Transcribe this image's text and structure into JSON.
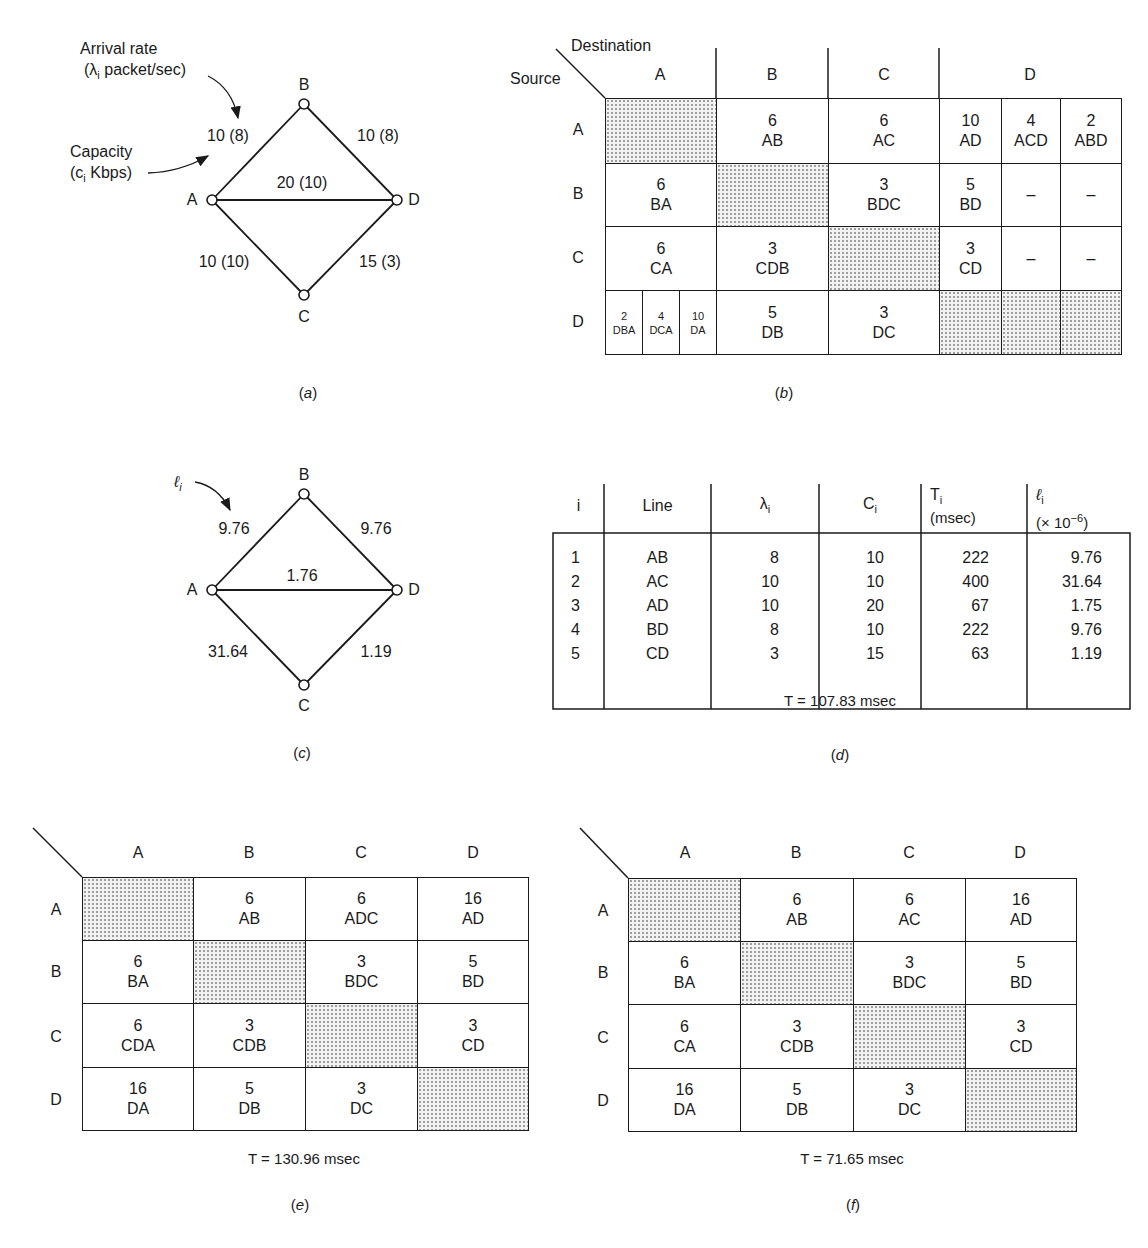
{
  "panel_a": {
    "caption": "a",
    "annotations": {
      "arrival_rate_title": "Arrival rate",
      "arrival_rate_unit": "(λ",
      "arrival_rate_sub": "i",
      "arrival_rate_unit_rest": " packet/sec)",
      "capacity_title": "Capacity",
      "capacity_unit": "(c",
      "capacity_sub": "i",
      "capacity_unit_rest": " Kbps)"
    },
    "nodes": [
      "A",
      "B",
      "C",
      "D"
    ],
    "edges": [
      {
        "line": "AB",
        "label": "10 (8)",
        "capacity": 10,
        "arrival_rate": 8
      },
      {
        "line": "BD",
        "label": "10 (8)",
        "capacity": 10,
        "arrival_rate": 8
      },
      {
        "line": "AD",
        "label": "20 (10)",
        "capacity": 20,
        "arrival_rate": 10
      },
      {
        "line": "AC",
        "label": "10 (10)",
        "capacity": 10,
        "arrival_rate": 10
      },
      {
        "line": "CD",
        "label": "15 (3)",
        "capacity": 15,
        "arrival_rate": 3
      }
    ]
  },
  "panel_b": {
    "caption": "b",
    "corner_destination": "Destination",
    "corner_source": "Source",
    "col_headers": [
      "A",
      "B",
      "C",
      "D"
    ],
    "row_headers": [
      "A",
      "B",
      "C",
      "D"
    ],
    "rows": {
      "A": {
        "A": null,
        "B": {
          "v": "6",
          "r": "AB"
        },
        "C": {
          "v": "6",
          "r": "AC"
        },
        "D": [
          {
            "v": "10",
            "r": "AD"
          },
          {
            "v": "4",
            "r": "ACD"
          },
          {
            "v": "2",
            "r": "ABD"
          }
        ]
      },
      "B": {
        "A": {
          "v": "6",
          "r": "BA"
        },
        "B": null,
        "C": {
          "v": "3",
          "r": "BDC"
        },
        "D": [
          {
            "v": "5",
            "r": "BD"
          },
          {
            "v": "–",
            "r": ""
          },
          {
            "v": "–",
            "r": ""
          }
        ]
      },
      "C": {
        "A": {
          "v": "6",
          "r": "CA"
        },
        "B": {
          "v": "3",
          "r": "CDB"
        },
        "C": null,
        "D": [
          {
            "v": "3",
            "r": "CD"
          },
          {
            "v": "–",
            "r": ""
          },
          {
            "v": "–",
            "r": ""
          }
        ]
      },
      "D": {
        "A": [
          {
            "v": "2",
            "r": "DBA"
          },
          {
            "v": "4",
            "r": "DCA"
          },
          {
            "v": "10",
            "r": "DA"
          }
        ],
        "B": {
          "v": "5",
          "r": "DB"
        },
        "C": {
          "v": "3",
          "r": "DC"
        },
        "D": null
      }
    }
  },
  "panel_c": {
    "caption": "c",
    "annotation": "ℓ",
    "annotation_sub": "i",
    "nodes": [
      "A",
      "B",
      "C",
      "D"
    ],
    "edges": [
      {
        "line": "AB",
        "label": "9.76"
      },
      {
        "line": "BD",
        "label": "9.76"
      },
      {
        "line": "AD",
        "label": "1.76"
      },
      {
        "line": "AC",
        "label": "31.64"
      },
      {
        "line": "CD",
        "label": "1.19"
      }
    ]
  },
  "panel_d": {
    "caption": "d",
    "headers": {
      "i": "i",
      "line": "Line",
      "lambda": "λ",
      "lambda_sub": "i",
      "c": "C",
      "c_sub": "i",
      "t": "T",
      "t_sub": "i",
      "t_unit": "(msec)",
      "l": "ℓ",
      "l_sub": "i",
      "l_unit": "(× 10",
      "l_exp": "−6",
      "l_close": ")"
    },
    "rows": [
      {
        "i": "1",
        "line": "AB",
        "lambda": "8",
        "c": "10",
        "t": "222",
        "l": "9.76"
      },
      {
        "i": "2",
        "line": "AC",
        "lambda": "10",
        "c": "10",
        "t": "400",
        "l": "31.64"
      },
      {
        "i": "3",
        "line": "AD",
        "lambda": "10",
        "c": "20",
        "t": "67",
        "l": "1.75"
      },
      {
        "i": "4",
        "line": "BD",
        "lambda": "8",
        "c": "10",
        "t": "222",
        "l": "9.76"
      },
      {
        "i": "5",
        "line": "CD",
        "lambda": "3",
        "c": "15",
        "t": "63",
        "l": "1.19"
      }
    ],
    "total": "T = 107.83 msec"
  },
  "panel_e": {
    "caption": "e",
    "col_headers": [
      "A",
      "B",
      "C",
      "D"
    ],
    "row_headers": [
      "A",
      "B",
      "C",
      "D"
    ],
    "cells": [
      [
        null,
        {
          "v": "6",
          "r": "AB"
        },
        {
          "v": "6",
          "r": "ADC"
        },
        {
          "v": "16",
          "r": "AD"
        }
      ],
      [
        {
          "v": "6",
          "r": "BA"
        },
        null,
        {
          "v": "3",
          "r": "BDC"
        },
        {
          "v": "5",
          "r": "BD"
        }
      ],
      [
        {
          "v": "6",
          "r": "CDA"
        },
        {
          "v": "3",
          "r": "CDB"
        },
        null,
        {
          "v": "3",
          "r": "CD"
        }
      ],
      [
        {
          "v": "16",
          "r": "DA"
        },
        {
          "v": "5",
          "r": "DB"
        },
        {
          "v": "3",
          "r": "DC"
        },
        null
      ]
    ],
    "total": "T = 130.96 msec"
  },
  "panel_f": {
    "caption": "f",
    "col_headers": [
      "A",
      "B",
      "C",
      "D"
    ],
    "row_headers": [
      "A",
      "B",
      "C",
      "D"
    ],
    "cells": [
      [
        null,
        {
          "v": "6",
          "r": "AB"
        },
        {
          "v": "6",
          "r": "AC"
        },
        {
          "v": "16",
          "r": "AD"
        }
      ],
      [
        {
          "v": "6",
          "r": "BA"
        },
        null,
        {
          "v": "3",
          "r": "BDC"
        },
        {
          "v": "5",
          "r": "BD"
        }
      ],
      [
        {
          "v": "6",
          "r": "CA"
        },
        {
          "v": "3",
          "r": "CDB"
        },
        null,
        {
          "v": "3",
          "r": "CD"
        }
      ],
      [
        {
          "v": "16",
          "r": "DA"
        },
        {
          "v": "5",
          "r": "DB"
        },
        {
          "v": "3",
          "r": "DC"
        },
        null
      ]
    ],
    "total": "T = 71.65 msec"
  }
}
